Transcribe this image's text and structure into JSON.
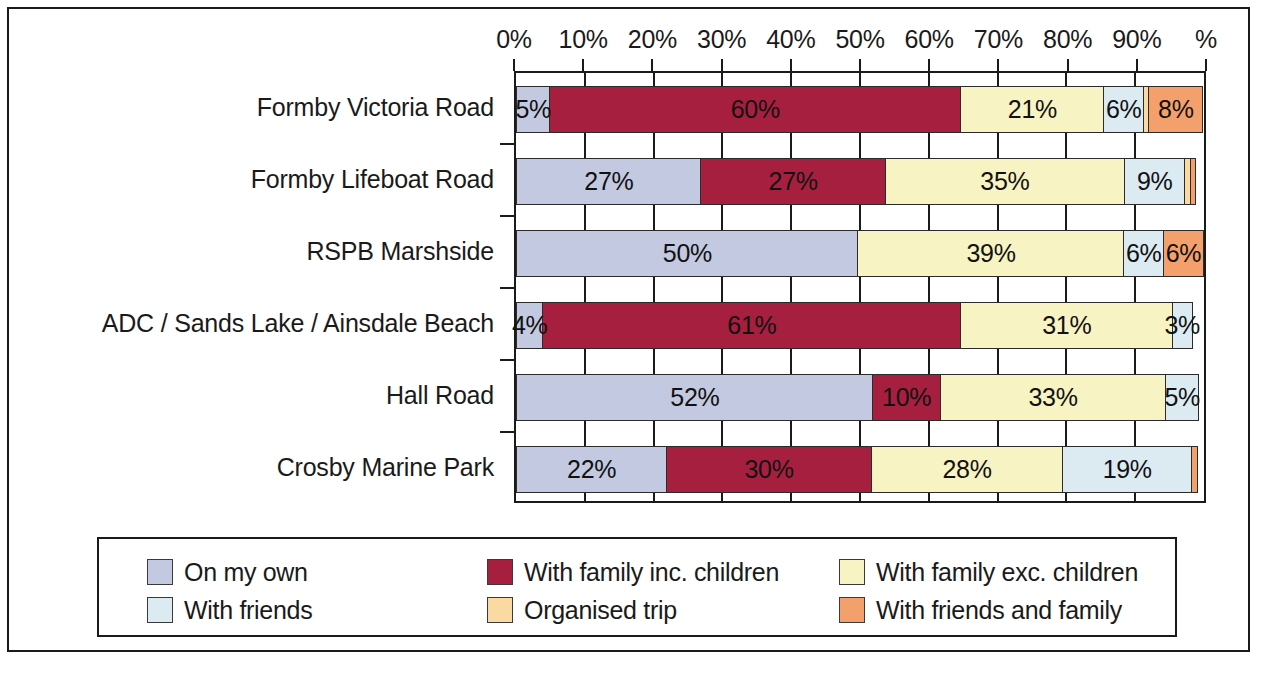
{
  "chart_data": {
    "type": "bar",
    "orientation": "horizontal",
    "stacked": true,
    "normalized_percent": true,
    "title": "",
    "subtitle": "",
    "xlabel": "",
    "ylabel": "",
    "xlim": [
      0,
      100
    ],
    "grid": true,
    "legend_position": "bottom",
    "x_tick_labels": [
      "0%",
      "10%",
      "20%",
      "30%",
      "40%",
      "50%",
      "60%",
      "70%",
      "80%",
      "90%",
      "%"
    ],
    "x_tick_values": [
      0,
      10,
      20,
      30,
      40,
      50,
      60,
      70,
      80,
      90,
      100
    ],
    "categories": [
      "Formby Victoria Road",
      "Formby Lifeboat Road",
      "RSPB Marshside",
      "ADC / Sands Lake / Ainsdale Beach",
      "Hall Road",
      "Crosby Marine Park"
    ],
    "series": [
      {
        "name": "On my own",
        "color": "#c3c9e0",
        "values": [
          5,
          27,
          50,
          4,
          52,
          22
        ],
        "labels": [
          "5%",
          "27%",
          "50%",
          "4%",
          "52%",
          "22%"
        ]
      },
      {
        "name": "With family inc. children",
        "color": "#a71f3f",
        "values": [
          60,
          27,
          0,
          61,
          10,
          30
        ],
        "labels": [
          "60%",
          "27%",
          "",
          "61%",
          "10%",
          "30%"
        ]
      },
      {
        "name": "With family exc. children",
        "color": "#f8f3c2",
        "values": [
          21,
          35,
          39,
          31,
          33,
          28
        ],
        "labels": [
          "21%",
          "35%",
          "39%",
          "31%",
          "33%",
          "28%"
        ]
      },
      {
        "name": "With friends",
        "color": "#dceaf2",
        "values": [
          6,
          9,
          6,
          3,
          5,
          19
        ],
        "labels": [
          "6%",
          "9%",
          "6%",
          "3%",
          "5%",
          "19%"
        ]
      },
      {
        "name": "Organised trip",
        "color": "#fbd9a2",
        "values": [
          1,
          1,
          0,
          0,
          0,
          0
        ],
        "labels": [
          "",
          "",
          "",
          "",
          "",
          ""
        ]
      },
      {
        "name": "With friends and family",
        "color": "#f4a06c",
        "values": [
          8,
          1,
          6,
          0,
          0,
          1
        ],
        "labels": [
          "8%",
          "",
          "6%",
          "",
          "",
          ""
        ]
      }
    ]
  },
  "legend": {
    "items": [
      {
        "label": "On my own",
        "color": "#c3c9e0"
      },
      {
        "label": "With family inc. children",
        "color": "#a71f3f"
      },
      {
        "label": "With family exc. children",
        "color": "#f8f3c2"
      },
      {
        "label": "With friends",
        "color": "#dceaf2"
      },
      {
        "label": "Organised trip",
        "color": "#fbd9a2"
      },
      {
        "label": "With friends and family",
        "color": "#f4a06c"
      }
    ]
  }
}
